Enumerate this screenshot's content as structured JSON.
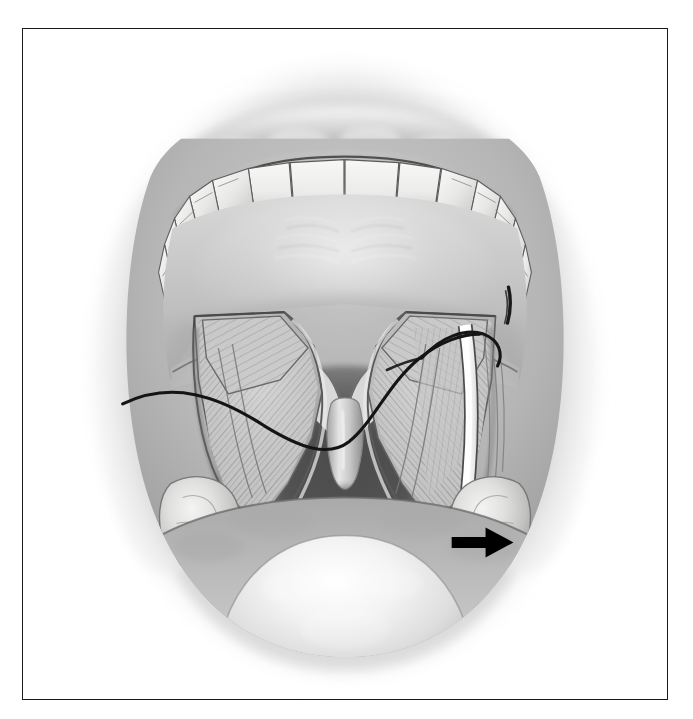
{
  "figure": {
    "title": "Intraoral view of palatoplasty",
    "subtitle": "Bilateral palatal flaps elevated with suture placement",
    "modality": "medical line-and-tone illustration",
    "palette": {
      "background": "#ffffff",
      "frame_border": "#1b1b1b",
      "tissue_light": "#e2e2e2",
      "tissue_mid": "#b4b4b4",
      "tissue_dark": "#8a8a8a",
      "oropharynx_shadow": "#5d5d5d",
      "tooth_white": "#f2f2f0",
      "raw_surface_white": "#fbfbf9",
      "suture_black": "#141414",
      "arrow_black": "#000000"
    },
    "frame": {
      "x": 22,
      "y": 28,
      "width": 646,
      "height": 672,
      "stroke_width": 1.4
    }
  },
  "anatomy": {
    "labels": [
      "upper lip",
      "maxillary incisors",
      "maxillary premolars and molars",
      "hard palate",
      "palatal mucoperiosteal flap left",
      "palatal mucoperiosteal flap right",
      "levator veli palatini muscle",
      "uvula",
      "oropharynx",
      "palatine tonsil left",
      "palatine tonsil right",
      "tongue dorsum",
      "lateral relaxing incision"
    ],
    "teeth": {
      "incisor_count": 4,
      "posterior_count_per_side": 5
    }
  },
  "instruments": {
    "suture": {
      "name": "suture thread",
      "color": "#141414",
      "stroke_width": 3.1,
      "description": "single long black suture running from the left field across the soft palate and looping over the right flap"
    },
    "suture_stub": {
      "name": "suture stub at incision apex",
      "color": "#1a1a1a"
    }
  },
  "annotations": {
    "arrow": {
      "name": "pointer-arrow",
      "direction": "right",
      "color": "#000000",
      "tip_x": 514,
      "tip_y": 543,
      "tail_x": 452,
      "tail_y": 543,
      "shaft_height": 11,
      "head_width": 28,
      "head_height": 30,
      "points_to": "lateral relaxing incision"
    }
  }
}
